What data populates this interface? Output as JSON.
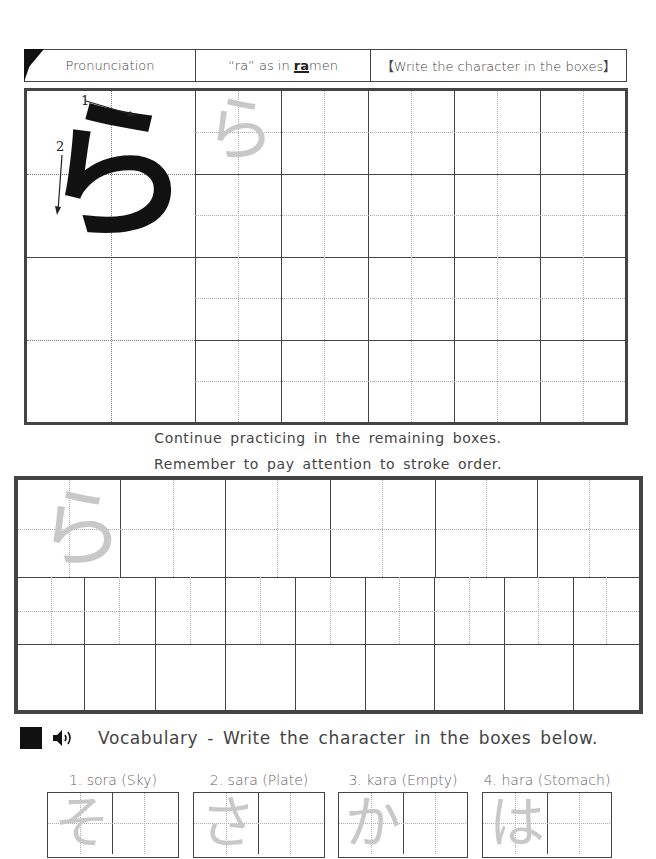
{
  "header": {
    "pronunciation_label": "Pronunciation",
    "sound_prefix": "“ra” as in ",
    "sound_highlight": "ra",
    "sound_suffix": "men",
    "instruction": "【Write the character in the boxes】"
  },
  "model_character": {
    "character": "ら",
    "stroke_numbers": [
      "1",
      "2"
    ],
    "trace_character": "ら"
  },
  "practice_instructions": {
    "line1": "Continue practicing in the remaining boxes.",
    "line2": "Remember to pay attention to stroke order."
  },
  "vocabulary": {
    "title": "Vocabulary - Write the character in the boxes below.",
    "icons": [
      "black-square-icon",
      "speaker-icon"
    ],
    "speaker_glyph": "🔊",
    "words": [
      {
        "label": "1. sora (Sky)",
        "trace": "そ"
      },
      {
        "label": "2. sara (Plate)",
        "trace": "さ"
      },
      {
        "label": "3. kara (Empty)",
        "trace": "か"
      },
      {
        "label": "4. hara (Stomach)",
        "trace": "は"
      }
    ]
  },
  "colors": {
    "grid_line": "#444444",
    "guide_line": "#aaaaaa",
    "trace_gray": "#c8c8c8",
    "ink": "#111111"
  }
}
